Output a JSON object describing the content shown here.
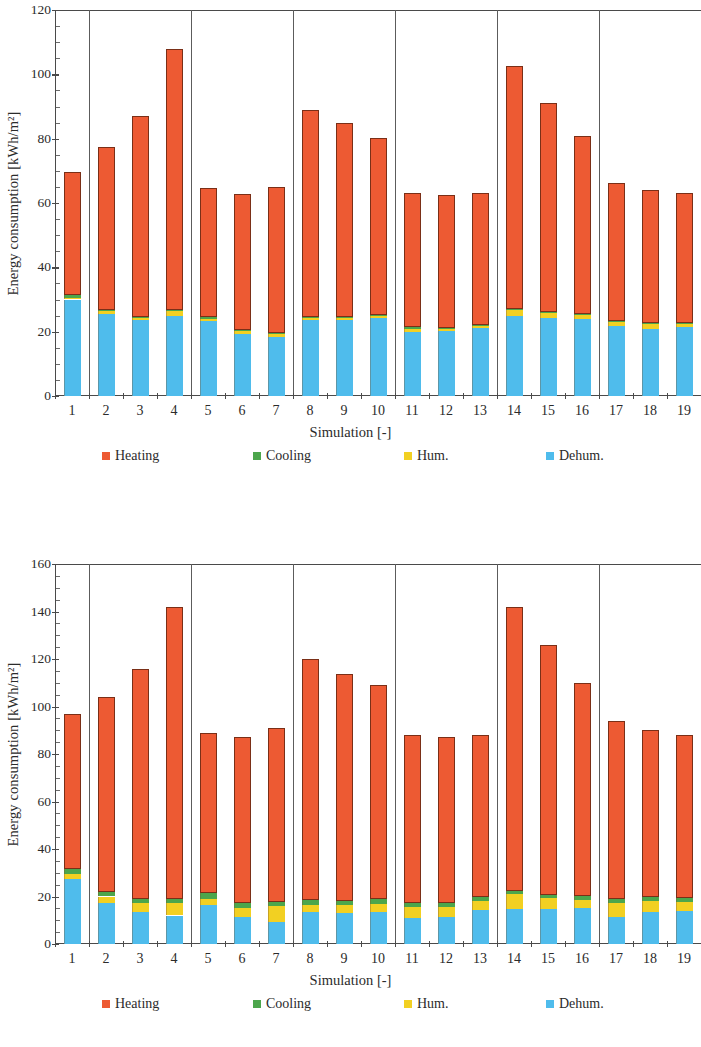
{
  "colors": {
    "heating": "#ED5A33",
    "cooling": "#4CA64C",
    "hum": "#F2D022",
    "dehum": "#4FBCEC",
    "axis": "#4a4a4a",
    "text": "#2b2b2b"
  },
  "legend": {
    "items": [
      {
        "key": "heating",
        "label": "Heating",
        "color": "#ED5A33"
      },
      {
        "key": "cooling",
        "label": "Cooling",
        "color": "#4CA64C"
      },
      {
        "key": "hum",
        "label": "Hum.",
        "color": "#F2D022"
      },
      {
        "key": "dehum",
        "label": "Dehum.",
        "color": "#4FBCEC"
      }
    ]
  },
  "chart_data": [
    {
      "id": "top",
      "type": "bar",
      "stacked": true,
      "title": "",
      "xlabel": "Simulation [-]",
      "ylabel": "Energy consumption [kWh/m²]",
      "ylim": [
        0,
        120
      ],
      "yticks": [
        0,
        20,
        40,
        60,
        80,
        100,
        120
      ],
      "yminor_step": 5,
      "grid": false,
      "legend_position": "bottom",
      "categories": [
        "1",
        "2",
        "3",
        "4",
        "5",
        "6",
        "7",
        "8",
        "9",
        "10",
        "11",
        "12",
        "13",
        "14",
        "15",
        "16",
        "17",
        "18",
        "19"
      ],
      "group_separators_after": [
        1,
        4,
        7,
        10,
        13,
        16
      ],
      "clipped_right": true,
      "stack_order": [
        "dehum",
        "hum",
        "cooling",
        "heating"
      ],
      "series": [
        {
          "name": "Dehum.",
          "key": "dehum",
          "color": "#4FBCEC",
          "values": [
            30.0,
            25.6,
            23.7,
            24.8,
            23.4,
            19.3,
            18.2,
            23.6,
            23.5,
            24.2,
            20.0,
            20.1,
            21.2,
            25.0,
            24.4,
            24.0,
            21.8,
            20.9,
            21.4
          ]
        },
        {
          "name": "Hum.",
          "key": "hum",
          "color": "#F2D022",
          "values": [
            0.5,
            1.0,
            0.8,
            1.6,
            0.5,
            1.0,
            1.3,
            0.8,
            0.9,
            0.7,
            0.8,
            0.7,
            0.6,
            1.6,
            1.5,
            1.1,
            1.3,
            1.4,
            1.0
          ]
        },
        {
          "name": "Cooling",
          "key": "cooling",
          "color": "#4CA64C",
          "values": [
            0.8,
            0.2,
            0.2,
            0.2,
            0.8,
            0.2,
            0.2,
            0.2,
            0.2,
            0.2,
            0.5,
            0.4,
            0.4,
            0.3,
            0.3,
            0.3,
            0.3,
            0.3,
            0.3
          ]
        },
        {
          "name": "Heating",
          "key": "heating",
          "color": "#ED5A33",
          "values": [
            38.2,
            50.7,
            62.3,
            81.3,
            40.0,
            42.3,
            45.3,
            64.4,
            60.4,
            55.0,
            41.7,
            41.3,
            41.0,
            75.6,
            65.0,
            55.4,
            42.7,
            41.5,
            40.4
          ]
        }
      ],
      "totals": [
        69.5,
        77.5,
        87.0,
        107.9,
        64.7,
        62.8,
        65.0,
        89.0,
        85.0,
        80.1,
        63.0,
        62.5,
        63.2,
        102.5,
        91.2,
        80.8,
        66.1,
        64.1,
        63.1
      ]
    },
    {
      "id": "bottom",
      "type": "bar",
      "stacked": true,
      "title": "",
      "xlabel": "Simulation [-]",
      "ylabel": "Energy consumption [kWh/m²]",
      "ylim": [
        0,
        160
      ],
      "yticks": [
        0,
        20,
        40,
        60,
        80,
        100,
        120,
        140,
        160
      ],
      "yminor_step": 5,
      "grid": false,
      "legend_position": "bottom",
      "categories": [
        "1",
        "2",
        "3",
        "4",
        "5",
        "6",
        "7",
        "8",
        "9",
        "10",
        "11",
        "12",
        "13",
        "14",
        "15",
        "16",
        "17",
        "18",
        "19"
      ],
      "group_separators_after": [
        1,
        4,
        7,
        10,
        13,
        16
      ],
      "clipped_right": true,
      "stack_order": [
        "dehum",
        "hum",
        "cooling",
        "heating"
      ],
      "series": [
        {
          "name": "Dehum.",
          "key": "dehum",
          "color": "#4FBCEC",
          "values": [
            27.2,
            17.4,
            13.4,
            12.0,
            16.3,
            11.2,
            9.4,
            13.4,
            13.1,
            13.4,
            11.1,
            11.3,
            14.5,
            14.9,
            14.6,
            15.1,
            11.5,
            13.6,
            14.0
          ]
        },
        {
          "name": "Hum.",
          "key": "hum",
          "color": "#F2D022",
          "values": [
            2.4,
            2.6,
            4.0,
            5.3,
            2.6,
            4.0,
            6.6,
            3.2,
            3.3,
            3.5,
            4.4,
            4.3,
            3.8,
            6.0,
            4.6,
            3.4,
            5.8,
            4.4,
            3.6
          ]
        },
        {
          "name": "Cooling",
          "key": "cooling",
          "color": "#4CA64C",
          "values": [
            2.1,
            1.9,
            1.6,
            1.6,
            2.7,
            2.1,
            1.8,
            1.9,
            1.8,
            1.9,
            1.7,
            1.7,
            1.6,
            1.6,
            1.6,
            1.7,
            1.6,
            1.6,
            1.6
          ]
        },
        {
          "name": "Heating",
          "key": "heating",
          "color": "#ED5A33",
          "values": [
            65.3,
            82.1,
            97.0,
            123.1,
            67.4,
            69.7,
            73.2,
            101.5,
            95.3,
            90.2,
            70.8,
            69.7,
            68.1,
            119.5,
            105.2,
            89.8,
            75.1,
            70.4,
            68.8
          ]
        }
      ],
      "totals": [
        97.0,
        104.0,
        116.0,
        142.0,
        89.0,
        87.0,
        91.0,
        120.0,
        113.5,
        109.0,
        88.0,
        87.0,
        88.0,
        142.0,
        126.0,
        110.0,
        94.0,
        90.0,
        88.0
      ]
    }
  ]
}
